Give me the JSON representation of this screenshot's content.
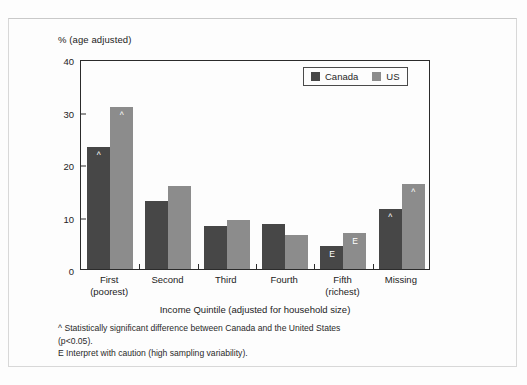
{
  "chart_data": {
    "type": "bar",
    "title": "",
    "subtitle": "",
    "ylabel": "% (age adjusted)",
    "xlabel": "Income Quintile (adjusted for household size)",
    "ylim": [
      0,
      40
    ],
    "yticks": [
      0,
      10,
      20,
      30,
      40
    ],
    "ytick_labels": [
      "0",
      "10",
      "20",
      "30",
      "40"
    ],
    "grid": false,
    "legend_position": "top-right",
    "categories": [
      "First (poorest)",
      "Second",
      "Third",
      "Fourth",
      "Fifth (richest)",
      "Missing"
    ],
    "category_lines": [
      [
        "First",
        "(poorest)"
      ],
      [
        "Second",
        ""
      ],
      [
        "Third",
        ""
      ],
      [
        "Fourth",
        ""
      ],
      [
        "Fifth",
        "(richest)"
      ],
      [
        "Missing",
        ""
      ]
    ],
    "series": [
      {
        "name": "Canada",
        "color": "#474747",
        "values": [
          23.3,
          13.0,
          8.1,
          8.6,
          4.4,
          11.5
        ],
        "markers": [
          "^",
          "",
          "",
          "",
          "E",
          "^"
        ]
      },
      {
        "name": "US",
        "color": "#8c8c8c",
        "values": [
          30.8,
          15.8,
          9.3,
          6.4,
          6.8,
          16.1
        ],
        "markers": [
          "^",
          "",
          "",
          "",
          "E",
          "^"
        ]
      }
    ],
    "annotations": [
      "^ Statistically significant difference between Canada and the United States (p<0.05).",
      "E Interpret with caution (high sampling variability)."
    ]
  },
  "legend": {
    "entries": [
      {
        "label": "Canada",
        "color": "#474747"
      },
      {
        "label": "US",
        "color": "#8c8c8c"
      }
    ]
  },
  "footnotes": {
    "caret_symbol": "^",
    "line1": "Statistically significant difference between Canada and the United States",
    "line2": "(p<0.05).",
    "line3": "E Interpret with caution (high sampling variability)."
  },
  "colors": {
    "canada": "#474747",
    "us": "#8c8c8c",
    "axis": "#2b2b2b",
    "frame": "#d8d8d8",
    "background": "#fdfdfd"
  }
}
